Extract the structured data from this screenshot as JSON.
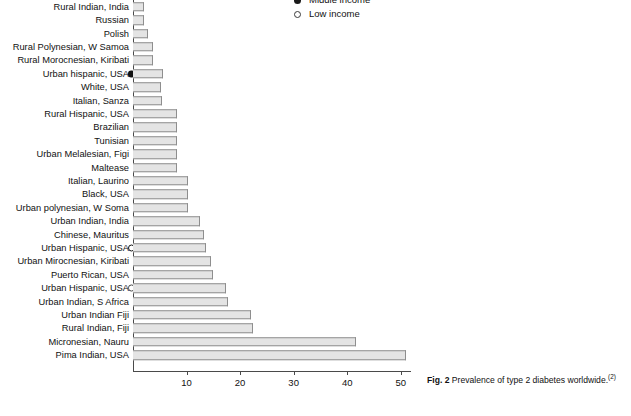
{
  "legend": {
    "entries": [
      {
        "label": "Middle income",
        "marker": "filled-circle",
        "clipped": true
      },
      {
        "label": "Low income",
        "marker": "open-circle",
        "clipped": false
      }
    ]
  },
  "caption": {
    "figure_number": "Fig. 2",
    "text": "Prevalence of type 2 diabetes worldwide.",
    "reference": "(2)"
  },
  "axis": {
    "ticks": [
      "10",
      "20",
      "30",
      "40",
      "50"
    ],
    "tick_values": [
      10,
      20,
      30,
      40,
      50
    ],
    "min": 0,
    "max": 52
  },
  "chart_data": {
    "type": "bar",
    "orientation": "horizontal",
    "title": "Prevalence of type 2 diabetes worldwide.",
    "xlabel": "",
    "ylabel": "",
    "xlim": [
      0,
      52
    ],
    "grid": false,
    "legend_position": "top-center",
    "categories": [
      "Rural Indian, India",
      "Russian",
      "Polish",
      "Rural Polynesian, W Samoa",
      "Rural Morocnesian, Kiribati",
      "Urban hispanic, USA",
      "White, USA",
      "Italian, Sanza",
      "Rural Hispanic, USA",
      "Brazilian",
      "Tunisian",
      "Urban Melalesian, Figi",
      "Maltease",
      "Italian, Laurino",
      "Black, USA",
      "Urban polynesian, W Soma",
      "Urban Indian, India",
      "Chinese, Mauritus",
      "Urban Hispanic, USA",
      "Urban Mirocnesian, Kiribati",
      "Puerto Rican, USA",
      "Urban Hispanic, USA",
      "Urban Indian, S Africa",
      "Urban Indian Fiji",
      "Rural Indian, Fiji",
      "Micronesian, Nauru",
      "Pima Indian, USA"
    ],
    "values": [
      2.1,
      2.1,
      2.8,
      3.7,
      3.7,
      5.6,
      5.2,
      5.4,
      8.2,
      8.2,
      8.2,
      8.2,
      8.2,
      10.3,
      10.3,
      10.3,
      12.5,
      13.2,
      13.6,
      14.6,
      15.0,
      17.4,
      17.8,
      22.0,
      22.4,
      41.7,
      51.0
    ],
    "markers": [
      null,
      null,
      null,
      null,
      null,
      "filled-circle",
      null,
      null,
      null,
      null,
      null,
      null,
      null,
      null,
      null,
      null,
      null,
      null,
      "open-circle-bold",
      null,
      null,
      "open-circle-thin",
      null,
      null,
      null,
      null,
      null
    ]
  }
}
